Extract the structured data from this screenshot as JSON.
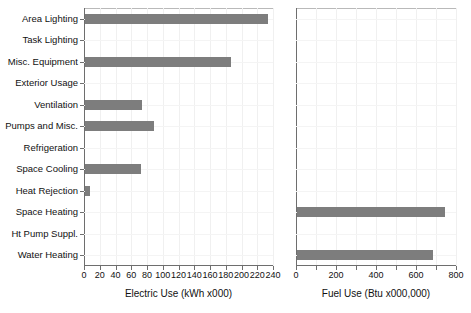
{
  "chart_data": [
    {
      "type": "bar",
      "orientation": "horizontal",
      "panel": "left",
      "title": "",
      "xlabel": "Electric Use (kWh x000)",
      "ylabel": "",
      "xlim": [
        0,
        240
      ],
      "xticks": [
        0,
        20,
        40,
        60,
        80,
        100,
        120,
        140,
        160,
        180,
        200,
        220,
        240
      ],
      "xticklabels": [
        "0",
        "20",
        "40",
        "60",
        "80",
        "100",
        "120",
        "140",
        "160",
        "180",
        "200",
        "220",
        "240"
      ],
      "grid": true,
      "legend": "none",
      "bar_color": "#7d7d7d",
      "categories": [
        "Area Lighting",
        "Task Lighting",
        "Misc. Equipment",
        "Exterior Usage",
        "Ventilation",
        "Pumps and Misc.",
        "Refrigeration",
        "Space Cooling",
        "Heat Rejection",
        "Space Heating",
        "Ht Pump Suppl.",
        "Water Heating"
      ],
      "values": [
        232,
        0,
        185,
        0,
        72,
        88,
        0,
        71,
        6,
        0,
        0,
        0
      ]
    },
    {
      "type": "bar",
      "orientation": "horizontal",
      "panel": "right",
      "title": "",
      "xlabel": "Fuel Use (Btu x000,000)",
      "ylabel": "",
      "xlim": [
        0,
        800
      ],
      "xticks": [
        0,
        100,
        200,
        300,
        400,
        500,
        600,
        700,
        800
      ],
      "xticklabels": [
        "0",
        "",
        "200",
        "",
        "400",
        "",
        "600",
        "",
        "800"
      ],
      "grid": true,
      "legend": "none",
      "bar_color": "#7d7d7d",
      "categories": [
        "Area Lighting",
        "Task Lighting",
        "Misc. Equipment",
        "Exterior Usage",
        "Ventilation",
        "Pumps and Misc.",
        "Refrigeration",
        "Space Cooling",
        "Heat Rejection",
        "Space Heating",
        "Ht Pump Suppl.",
        "Water Heating"
      ],
      "values": [
        0,
        0,
        0,
        0,
        0,
        0,
        0,
        0,
        0,
        740,
        0,
        678
      ]
    }
  ],
  "left_chart": {
    "axis_title": "Electric Use (kWh x000)",
    "ticks": [
      "0",
      "20",
      "40",
      "60",
      "80",
      "100",
      "120",
      "140",
      "160",
      "180",
      "200",
      "220",
      "240"
    ],
    "categories": [
      "Area Lighting",
      "Task Lighting",
      "Misc. Equipment",
      "Exterior Usage",
      "Ventilation",
      "Pumps and Misc.",
      "Refrigeration",
      "Space Cooling",
      "Heat Rejection",
      "Space Heating",
      "Ht Pump Suppl.",
      "Water Heating"
    ]
  },
  "right_chart": {
    "axis_title": "Fuel Use (Btu x000,000)",
    "ticks": [
      "0",
      "200",
      "400",
      "600",
      "800"
    ]
  }
}
